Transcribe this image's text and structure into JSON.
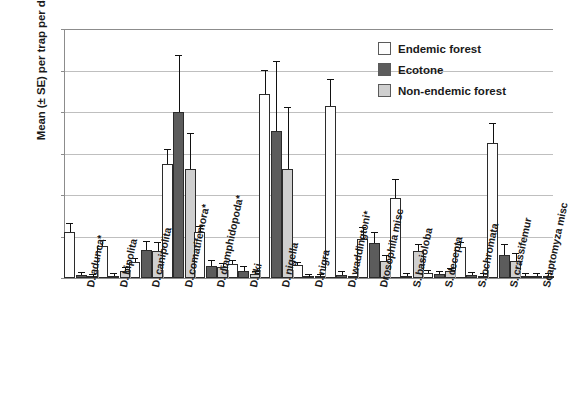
{
  "chart_data": {
    "type": "bar",
    "title": "",
    "xlabel": "",
    "ylabel": "Mean (± SE) per trap per day",
    "ylim": [
      0,
      3
    ],
    "ytick_labels": [
      "0",
      "0.5",
      "1",
      "1.5",
      "2",
      "2.5",
      "3"
    ],
    "ytick_values": [
      0,
      0.5,
      1,
      1.5,
      2,
      2.5,
      3
    ],
    "grid": true,
    "legend_position": "top-right",
    "categories": [
      "D. adunca*",
      "D. bipolita",
      "D. canipolita",
      "D. comatifemora*",
      "D. diamphidopoda*",
      "D. iki",
      "D. nigella",
      "D. nigra",
      "D. waddingtoni*",
      "Drosophila misc",
      "S. basioloba",
      "S. decepta",
      "S. ochromata",
      "S. crassifemur",
      "Scaptomyza misc"
    ],
    "series": [
      {
        "name": "Endemic forest",
        "color": "#fdfdfd",
        "values": [
          0.56,
          0.38,
          0.19,
          1.37,
          0.56,
          0.17,
          2.22,
          0.16,
          2.07,
          0.47,
          0.96,
          0.06,
          0.37,
          1.63,
          0.03
        ],
        "errors": [
          0.09,
          0.06,
          0.04,
          0.17,
          0.05,
          0.04,
          0.28,
          0.02,
          0.31,
          0.13,
          0.22,
          0.03,
          0.05,
          0.22,
          0.01
        ]
      },
      {
        "name": "Ecotone",
        "color": "#5c5c5c",
        "values": [
          0.04,
          0.02,
          0.34,
          2.0,
          0.15,
          0.09,
          1.77,
          0.01,
          0.04,
          0.42,
          0.02,
          0.05,
          0.04,
          0.28,
          0.03
        ],
        "errors": [
          0.02,
          0.01,
          0.09,
          0.67,
          0.05,
          0.04,
          0.83,
          0.01,
          0.03,
          0.12,
          0.01,
          0.02,
          0.02,
          0.12,
          0.01
        ]
      },
      {
        "name": "Non-endemic forest",
        "color": "#cfcfcf",
        "values": [
          0.01,
          0.09,
          0.33,
          1.31,
          0.13,
          0.05,
          1.31,
          0.01,
          0.0,
          0.21,
          0.33,
          0.08,
          0.03,
          0.21,
          0.02
        ],
        "errors": [
          0.01,
          0.03,
          0.09,
          0.43,
          0.04,
          0.02,
          0.74,
          0.01,
          0.0,
          0.06,
          0.07,
          0.03,
          0.02,
          0.08,
          0.01
        ]
      }
    ]
  }
}
